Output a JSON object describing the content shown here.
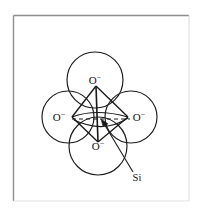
{
  "figure": {
    "caption_present": false,
    "background_color": "#ffffff",
    "frame_color": "#9a9a9a",
    "line_color": "#1a1a1a",
    "frame": {
      "x": 13,
      "y": 15,
      "width": 176,
      "height": 186
    },
    "atoms": [
      {
        "id": "oxygen-top",
        "label": "O",
        "charge": "−",
        "cx": 95,
        "cy": 80,
        "r": 28,
        "label_x": 95,
        "label_y": 84
      },
      {
        "id": "oxygen-left",
        "label": "O",
        "charge": "−",
        "cx": 68,
        "cy": 117,
        "r": 26,
        "label_x": 59,
        "label_y": 121
      },
      {
        "id": "oxygen-right",
        "label": "O",
        "charge": "−",
        "cx": 131,
        "cy": 117,
        "r": 26,
        "label_x": 139,
        "label_y": 121
      },
      {
        "id": "oxygen-bottom",
        "label": "O",
        "charge": "−",
        "cx": 98,
        "cy": 146,
        "r": 29,
        "label_x": 98,
        "label_y": 150
      }
    ],
    "center_atom": {
      "id": "silicon-center",
      "label": "Si",
      "label_x": 137,
      "label_y": 181,
      "target_x": 101,
      "target_y": 120,
      "leader_from_x": 133,
      "leader_from_y": 172
    },
    "tetrahedron": {
      "vertices": {
        "top": {
          "x": 96,
          "y": 86
        },
        "left": {
          "x": 72,
          "y": 117
        },
        "right": {
          "x": 128,
          "y": 117
        },
        "bottom": {
          "x": 98,
          "y": 142
        }
      },
      "solid_edges": [
        "top-left",
        "top-right",
        "top-bottom",
        "left-bottom",
        "right-bottom",
        "left-right-front"
      ],
      "hidden_edges_dashed": [
        "left-center-right"
      ]
    }
  }
}
